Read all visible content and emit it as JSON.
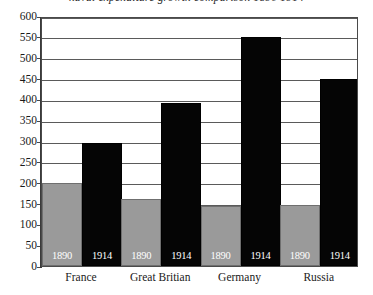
{
  "title": "naval expenditure growth comparison 1890 1914",
  "chart_data": {
    "type": "bar",
    "title": "",
    "xlabel": "",
    "ylabel": "",
    "ylim": [
      0,
      600
    ],
    "ytick_step": 50,
    "yticks": [
      0,
      50,
      100,
      150,
      200,
      250,
      300,
      350,
      400,
      450,
      500,
      550,
      600
    ],
    "grid": true,
    "legend_position": "none",
    "categories": [
      "France",
      "Great Britian",
      "Germany",
      "Russia"
    ],
    "series": [
      {
        "name": "1890",
        "color": "#9a9a9a",
        "values": [
          200,
          160,
          143,
          147
        ]
      },
      {
        "name": "1914",
        "color": "#050505",
        "values": [
          295,
          392,
          550,
          450
        ]
      }
    ],
    "bar_labels": {
      "series_1": "1890",
      "series_2": "1914"
    }
  }
}
